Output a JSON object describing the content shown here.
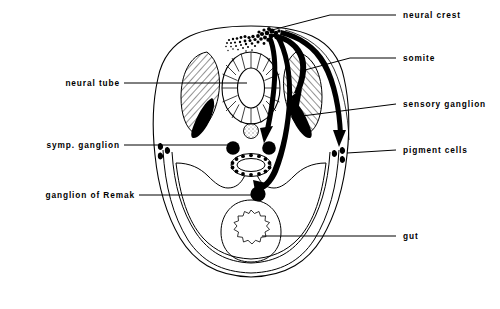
{
  "figure": {
    "background_color": "#ffffff",
    "line_color": "#000000",
    "labels_left": [
      {
        "id": "neural-tube",
        "text": "neural tube",
        "x": 115,
        "y": 86,
        "leader_x2": 247,
        "leader_y": 86
      },
      {
        "id": "symp-ganglion",
        "text": "symp. ganglion",
        "x": 115,
        "y": 148,
        "leader_x2": 234,
        "leader_y": 148
      },
      {
        "id": "ganglion-of-remak",
        "text": "ganglion of Remak",
        "x": 130,
        "y": 198,
        "leader_x2": 258,
        "leader_y": 198
      }
    ],
    "labels_right": [
      {
        "id": "neural-crest",
        "text": "neural crest",
        "x": 403,
        "y": 18,
        "leader_x1": 272,
        "leader_y1": 30,
        "leader_y": 15
      },
      {
        "id": "somite",
        "text": "somite",
        "x": 403,
        "y": 60,
        "leader_x1": 318,
        "leader_y1": 62,
        "leader_y": 60
      },
      {
        "id": "sensory-ganglion",
        "text": "sensory ganglion",
        "x": 403,
        "y": 105,
        "leader_x1": 315,
        "leader_y1": 108,
        "leader_y": 105
      },
      {
        "id": "pigment-cells",
        "text": "pigment cells",
        "x": 403,
        "y": 152,
        "leader_x1": 345,
        "leader_y1": 150,
        "leader_y": 152
      },
      {
        "id": "gut",
        "text": "gut",
        "x": 403,
        "y": 238,
        "leader_x1": 268,
        "leader_y1": 238,
        "leader_y": 238
      }
    ],
    "structures": [
      {
        "id": "body-outline",
        "name": "embryo-body-outline"
      },
      {
        "id": "neural-tube",
        "name": "neural-tube"
      },
      {
        "id": "notochord",
        "name": "notochord"
      },
      {
        "id": "somite-left",
        "name": "somite-left"
      },
      {
        "id": "somite-right",
        "name": "somite-right"
      },
      {
        "id": "sensory-ganglion-left",
        "name": "sensory-ganglion-left"
      },
      {
        "id": "sensory-ganglion-right",
        "name": "sensory-ganglion-right"
      },
      {
        "id": "symp-ganglion-left",
        "name": "sympathetic-ganglion-left"
      },
      {
        "id": "symp-ganglion-right",
        "name": "sympathetic-ganglion-right"
      },
      {
        "id": "dorsal-aorta",
        "name": "dorsal-aorta"
      },
      {
        "id": "ganglion-of-remak",
        "name": "ganglion-of-remak"
      },
      {
        "id": "gut",
        "name": "gut"
      },
      {
        "id": "coelom",
        "name": "coelom-cavity"
      },
      {
        "id": "pigment-cells-left",
        "name": "pigment-cells-left"
      },
      {
        "id": "pigment-cells-right",
        "name": "pigment-cells-right"
      },
      {
        "id": "neural-crest-cells",
        "name": "neural-crest-cell-cloud"
      }
    ],
    "migration_arrows": [
      {
        "id": "arrow-to-sensory-ganglion",
        "target": "sensory ganglion"
      },
      {
        "id": "arrow-to-symp-ganglion",
        "target": "symp. ganglion"
      },
      {
        "id": "arrow-to-remak",
        "target": "ganglion of Remak"
      },
      {
        "id": "arrow-to-pigment-cells",
        "target": "pigment cells"
      }
    ]
  }
}
